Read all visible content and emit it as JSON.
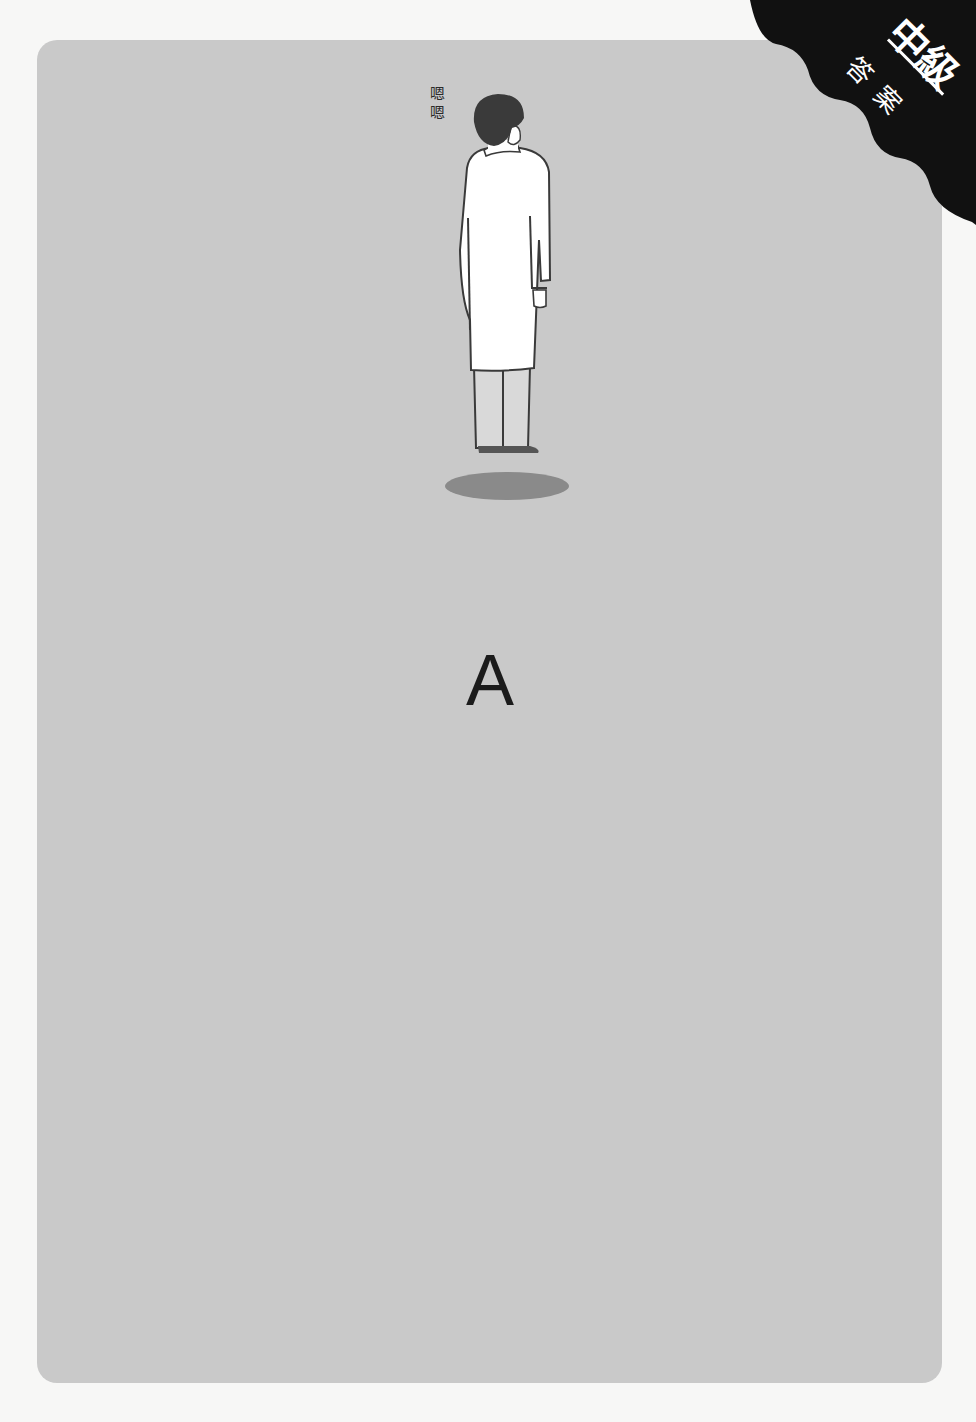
{
  "badge": {
    "level": "中級",
    "label": "答案",
    "background_color": "#111111",
    "text_color": "#ffffff"
  },
  "illustration": {
    "subject": "doctor-in-white-coat-facing-away",
    "speech_marks": "嗯嗯",
    "coat_color": "#ffffff",
    "hair_color": "#3a3a3a",
    "shadow_color": "#8a8a8a"
  },
  "answer": {
    "letter": "A"
  },
  "card": {
    "background_color": "#c9c9c9"
  }
}
